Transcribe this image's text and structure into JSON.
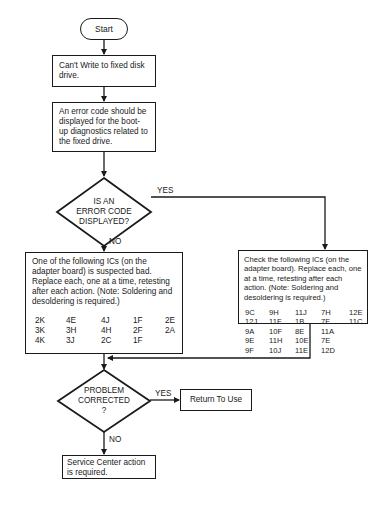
{
  "diagram": {
    "type": "flowchart",
    "header_fragment": "",
    "nodes": {
      "start": {
        "label": "Start"
      },
      "cant_write": {
        "label": "Can't Write to fixed disk drive."
      },
      "error_code_expected": {
        "label": "An error code should be displayed for the boot-up diagnostics related to the fixed drive."
      },
      "decision_error_code": {
        "label_lines": [
          "IS AN",
          "ERROR CODE",
          "DISPLAYED?"
        ]
      },
      "left_ics": {
        "text": "One of the following ICs (on the adapter board) is suspected bad. Replace each, one at a time, retesting  after each action. (Note: Soldering and  desoldering is required.)",
        "ic_columns": [
          [
            "2K",
            "3K",
            "4K"
          ],
          [
            "4E",
            "3H",
            "3J"
          ],
          [
            "4J",
            "4H",
            "2C"
          ],
          [
            "1F",
            "2F",
            "1F"
          ],
          [
            "2E",
            "2A",
            ""
          ]
        ]
      },
      "right_ics": {
        "text": "Check the following ICs (on the adapter board). Replace each, one at a time, retesting after each action. (Note: Soldering  and desoldering is required.)",
        "ic_columns": [
          [
            "9C",
            "12J",
            "9A",
            "9E",
            "9F"
          ],
          [
            "9H",
            "11F",
            "10F",
            "11H",
            "10J"
          ],
          [
            "11J",
            "1B",
            "8E",
            "10E",
            "11E"
          ],
          [
            "7H",
            "7F",
            "11A",
            "7E",
            "12D"
          ],
          [
            "12E",
            "11C",
            "",
            "",
            ""
          ]
        ]
      },
      "decision_corrected": {
        "label_lines": [
          "PROBLEM",
          "CORRECTED",
          "?"
        ]
      },
      "return_to_use": {
        "label": "Return To Use"
      },
      "service_center": {
        "label": "Service Center action is required."
      }
    },
    "edge_labels": {
      "error_yes": "YES",
      "error_no": "NO",
      "corrected_yes": "YES",
      "corrected_no": "NO"
    },
    "edges": [
      {
        "from": "start",
        "to": "cant_write"
      },
      {
        "from": "cant_write",
        "to": "error_code_expected"
      },
      {
        "from": "error_code_expected",
        "to": "decision_error_code"
      },
      {
        "from": "decision_error_code",
        "to": "right_ics",
        "label": "YES"
      },
      {
        "from": "decision_error_code",
        "to": "left_ics",
        "label": "NO"
      },
      {
        "from": "left_ics",
        "to": "decision_corrected"
      },
      {
        "from": "right_ics",
        "to": "decision_corrected"
      },
      {
        "from": "decision_corrected",
        "to": "return_to_use",
        "label": "YES"
      },
      {
        "from": "decision_corrected",
        "to": "service_center",
        "label": "NO"
      }
    ]
  }
}
